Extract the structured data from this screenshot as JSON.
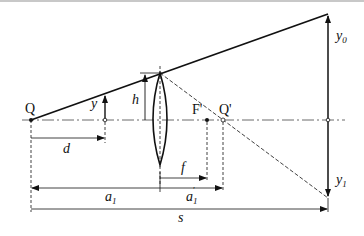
{
  "diagram": {
    "type": "thin-lens-optics",
    "colors": {
      "line": "#111111",
      "background": "#ffffff",
      "topbar": "#c8c8c8"
    },
    "labels": {
      "Q": "Q",
      "y": "y",
      "h": "h",
      "F_prime": "F'",
      "Q_prime": "Q'",
      "d": "d",
      "f": "f",
      "a1": "a",
      "a1_sub": "1",
      "a1_prime": "a",
      "a1_prime_sub": "1",
      "a1_prime_mark": "'",
      "s": "s",
      "y0": "y",
      "y0_sub": "0",
      "y1": "y",
      "y1_sub": "1"
    }
  }
}
